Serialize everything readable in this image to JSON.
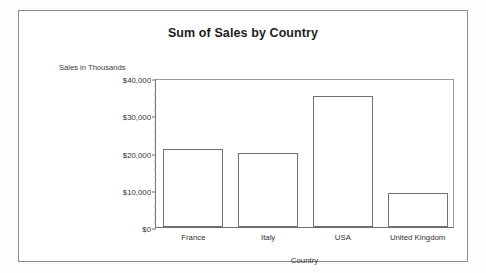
{
  "chart_data": {
    "type": "bar",
    "title": "Sum of Sales by Country",
    "xlabel": "Country",
    "ylabel": "Sales in Thousands",
    "categories": [
      "France",
      "Italy",
      "USA",
      "United Kingdom"
    ],
    "values": [
      21000,
      19800,
      35200,
      9200
    ],
    "ylim": [
      0,
      40000
    ],
    "ytick_values": [
      0,
      10000,
      20000,
      30000,
      40000
    ],
    "ytick_labels": [
      "$0",
      "$10,000",
      "$20,000",
      "$30,000",
      "$40,000"
    ],
    "minor_tick_step": 2000,
    "grid": false,
    "legend": false,
    "legend_position": "none",
    "series": [
      {
        "name": "Sum of Sales",
        "values": [
          21000,
          19800,
          35200,
          9200
        ]
      }
    ],
    "bar_fill_color": "#ffffff",
    "bar_border_color": "#707070",
    "axis_color": "#6f6f6f",
    "background_color": "#ffffff"
  }
}
